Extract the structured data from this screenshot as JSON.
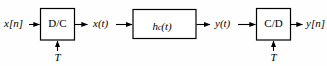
{
  "diagram": {
    "background_color": "#fefefe",
    "line_color": "#000000",
    "block_fill": "#ffffff",
    "blocks": [
      {
        "id": "dc",
        "label": "D/C",
        "clock_label": "T"
      },
      {
        "id": "hc",
        "label_base": "h",
        "label_sub": "c",
        "label_arg": "(t)"
      },
      {
        "id": "cd",
        "label": "C/D",
        "clock_label": "T"
      }
    ],
    "signals": {
      "input": "x[n]",
      "after_dc": "x(t)",
      "after_hc": "y(t)",
      "output": "y[n]"
    }
  }
}
